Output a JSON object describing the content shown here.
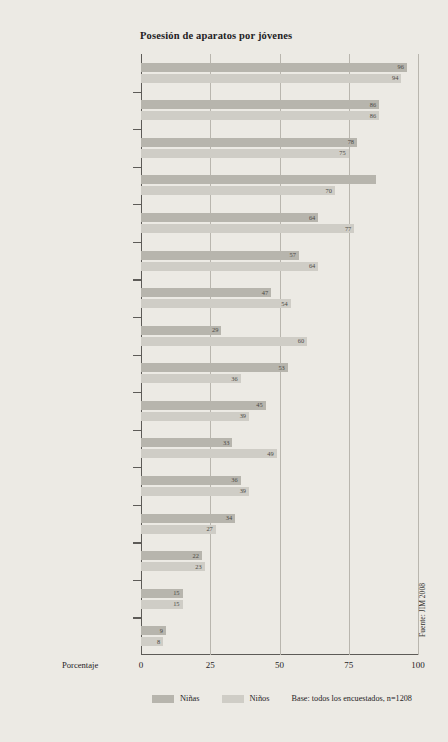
{
  "chart_data": {
    "type": "bar",
    "orientation": "horizontal",
    "title": "Posesión de aparatos por jóvenes",
    "xlabel": "Porcentaje",
    "ylabel": "",
    "xlim": [
      0,
      100
    ],
    "xticks": [
      0,
      25,
      50,
      75,
      100
    ],
    "xtick_labels": [
      "0",
      "25",
      "50",
      "75",
      "100"
    ],
    "grid": true,
    "grid_axis": "x",
    "legend_position": "bottom",
    "categories": [
      "Teléfono celular",
      "Reproductor de MP3",
      "Radio",
      "Reproductor de CD",
      "Computador/Laptop",
      "Televisor",
      "Acceso a Internet",
      "Consola de juegos TV/PC",
      "Cámara digital",
      "Grabadora",
      "Consola de juegos portátil",
      "Reproductor de DVD (no PC)",
      "Walkman/Discman",
      "Teléfono celular UMTS",
      "Videograbadora",
      "Grabador de mini disc"
    ],
    "series": [
      {
        "name": "Niñas",
        "color": "#b7b5ad",
        "values": [
          96,
          86,
          78,
          85,
          64,
          57,
          47,
          29,
          53,
          45,
          33,
          36,
          34,
          22,
          15,
          9
        ]
      },
      {
        "name": "Niños",
        "color": "#cfcdc6",
        "values": [
          94,
          86,
          75,
          70,
          77,
          64,
          54,
          60,
          36,
          39,
          49,
          39,
          27,
          23,
          15,
          8
        ]
      }
    ],
    "value_labels_shown": {
      "Niñas": [
        "96",
        "86",
        "78",
        "",
        "64",
        "57",
        "47",
        "29",
        "53",
        "45",
        "33",
        "36",
        "34",
        "22",
        "15",
        "9"
      ],
      "Niños": [
        "94",
        "86",
        "75",
        "70",
        "77",
        "64",
        "54",
        "60",
        "36",
        "39",
        "49",
        "39",
        "27",
        "23",
        "15",
        "8"
      ]
    },
    "annotations": {
      "base_note": "Base: todos los encuestados, n=1208",
      "source": "Fuente: JIM 2008"
    }
  },
  "legend": {
    "items": [
      {
        "label": "Niñas",
        "color": "#b7b5ad"
      },
      {
        "label": "Niños",
        "color": "#cfcdc6"
      }
    ],
    "base_note": "Base: todos los encuestados, n=1208"
  }
}
